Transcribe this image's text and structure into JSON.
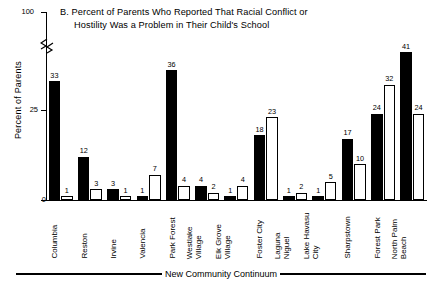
{
  "chart_data": {
    "type": "bar",
    "title": "B.  Percent of Parents Who Reported That Racial Conflict or Hostility Was a Problem in Their Child's School",
    "title_lines": [
      "B.  Percent of Parents Who Reported That Racial Conflict or",
      "Hostility Was a Problem in Their Child's School"
    ],
    "xlabel": "New Community Continuum",
    "ylabel": "Percent of Parents",
    "ylim": [
      0,
      100
    ],
    "y_ticks": [
      "0",
      "25",
      "100"
    ],
    "y_tick_values": [
      0,
      25,
      100
    ],
    "axis_break": true,
    "grid": false,
    "legend": "none",
    "categories": [
      "Columbia",
      "Reston",
      "Irvine",
      "Valencia",
      "Park Forest",
      "Westlake Village",
      "Elk Grove Village",
      "Foster City",
      "Laguna Niguel",
      "Lake Havasu City",
      "Sharpstown",
      "Forest Park",
      "North Palm Beach"
    ],
    "category_label_lines": [
      [
        "Columbia"
      ],
      [
        "Reston"
      ],
      [
        "Irvine"
      ],
      [
        "Valencia"
      ],
      [
        "Park Forest"
      ],
      [
        "Westlake",
        "Village"
      ],
      [
        "Elk Grove",
        "Village"
      ],
      [
        "Foster City"
      ],
      [
        "Laguna",
        "Niguel"
      ],
      [
        "Lake Havasu",
        "City"
      ],
      [
        "Sharpstown"
      ],
      [
        "Forest Park"
      ],
      [
        "North Palm",
        "Beach"
      ]
    ],
    "series": [
      {
        "name": "filled",
        "style": "solid-black",
        "values": [
          33,
          12,
          3,
          1,
          36,
          4,
          1,
          18,
          1,
          1,
          17,
          24,
          41
        ]
      },
      {
        "name": "open",
        "style": "open-white",
        "values": [
          1,
          3,
          1,
          7,
          4,
          2,
          4,
          23,
          2,
          5,
          10,
          32,
          24
        ]
      }
    ],
    "colors": {
      "filled": "#000000",
      "open": "#ffffff",
      "outline": "#000000",
      "background": "#ffffff"
    }
  }
}
